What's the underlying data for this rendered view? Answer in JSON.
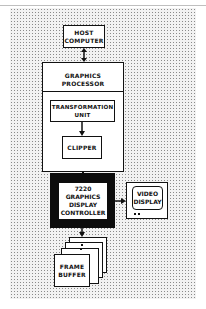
{
  "diagram": {
    "type": "block-diagram",
    "nodes": {
      "host": {
        "label": "HOST\nCOMPUTER"
      },
      "graphics_processor": {
        "label": "GRAPHICS\nPROCESSOR"
      },
      "transformation_unit": {
        "label": "TRANSFORMATION\nUNIT"
      },
      "clipper": {
        "label": "CLIPPER"
      },
      "gdc": {
        "label": "7220\nGRAPHICS\nDISPLAY\nCONTROLLER"
      },
      "video_display": {
        "label": "VIDEO\nDISPLAY"
      },
      "frame_buffer": {
        "label": "FRAME\nBUFFER"
      }
    },
    "edges": [
      {
        "from": "host",
        "to": "graphics_processor",
        "style": "bidirectional"
      },
      {
        "from": "transformation_unit",
        "to": "clipper",
        "style": "arrow"
      },
      {
        "from": "graphics_processor",
        "to": "gdc",
        "style": "line"
      },
      {
        "from": "gdc",
        "to": "video_display",
        "style": "arrow"
      },
      {
        "from": "gdc",
        "to": "frame_buffer",
        "style": "arrow"
      }
    ],
    "colors": {
      "background_dots": "#8a8a8a",
      "box_fill": "#ffffff",
      "stroke": "#111111",
      "gdc_frame": "#0c0c0c"
    }
  }
}
